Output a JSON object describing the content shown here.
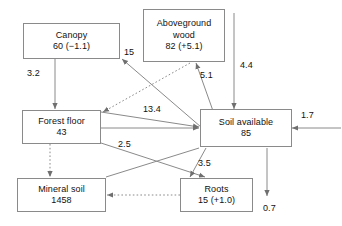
{
  "diagram": {
    "type": "flow-diagram",
    "title": "",
    "nodes": [
      {
        "id": "canopy",
        "line1": "Canopy",
        "line2": "60 (−1.1)"
      },
      {
        "id": "wood",
        "line1": "Aboveground",
        "line1b": "wood",
        "line2": "82 (+5.1)"
      },
      {
        "id": "floor",
        "line1": "Forest floor",
        "line2": "43"
      },
      {
        "id": "soil",
        "line1": "Soil available",
        "line2": "85"
      },
      {
        "id": "mineral",
        "line1": "Mineral soil",
        "line2": "1458"
      },
      {
        "id": "roots",
        "line1": "Roots",
        "line2": "15 (+1.0)"
      }
    ],
    "flows": [
      {
        "id": "canopy-to-floor",
        "label": "3.2",
        "style": "solid"
      },
      {
        "id": "soil-to-canopy",
        "label": "15",
        "style": "solid"
      },
      {
        "id": "soil-to-wood",
        "label": "5.1",
        "style": "solid"
      },
      {
        "id": "external-to-soil",
        "label": "4.4",
        "style": "solid"
      },
      {
        "id": "right-to-soil",
        "label": "1.7",
        "style": "solid"
      },
      {
        "id": "floor-to-soil",
        "label": "13.4",
        "style": "solid"
      },
      {
        "id": "floor-to-roots",
        "label": "2.5",
        "style": "solid"
      },
      {
        "id": "soil-to-roots",
        "label": "3.5",
        "style": "solid"
      },
      {
        "id": "soil-out",
        "label": "0.7",
        "style": "solid"
      },
      {
        "id": "floor-to-mineral",
        "label": "",
        "style": "dotted"
      },
      {
        "id": "roots-to-mineral",
        "label": "",
        "style": "dotted"
      },
      {
        "id": "wood-to-floor",
        "label": "",
        "style": "dotted"
      }
    ],
    "colors": {
      "stroke": "#8a8a8a",
      "text": "#111111",
      "background": "#ffffff"
    }
  }
}
